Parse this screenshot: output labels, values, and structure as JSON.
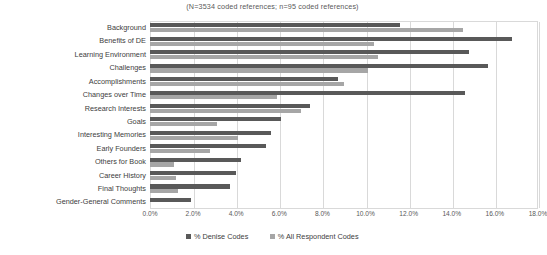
{
  "chart_data": {
    "type": "bar",
    "orientation": "horizontal",
    "title": "(N=3534 coded references; n=95 coded references)",
    "xlabel": "",
    "ylabel": "",
    "xlim": [
      0,
      18
    ],
    "xtick_labels": [
      "0.0%",
      "2.0%",
      "4.0%",
      "6.0%",
      "8.0%",
      "10.0%",
      "12.0%",
      "14.0%",
      "16.0%",
      "18.0%"
    ],
    "xticks": [
      0,
      2,
      4,
      6,
      8,
      10,
      12,
      14,
      16,
      18
    ],
    "grid": true,
    "legend_position": "bottom",
    "categories": [
      "Background",
      "Benefits of DE",
      "Learning Environment",
      "Challenges",
      "Accomplishments",
      "Changes over Time",
      "Research Interests",
      "Goals",
      "Interesting Memories",
      "Early Founders",
      "Others for Book",
      "Career History",
      "Final Thoughts",
      "Gender-General Comments"
    ],
    "series": [
      {
        "name": "% Denise Codes",
        "color": "#595959",
        "values": [
          11.6,
          16.8,
          14.8,
          15.7,
          8.7,
          14.6,
          7.4,
          6.1,
          5.6,
          5.4,
          4.2,
          4.0,
          3.7,
          1.9
        ]
      },
      {
        "name": "% All Respondent Codes",
        "color": "#a6a6a6",
        "values": [
          14.5,
          10.4,
          10.6,
          10.1,
          9.0,
          5.9,
          7.0,
          3.1,
          4.1,
          2.8,
          1.1,
          1.2,
          1.3,
          0.0
        ]
      }
    ]
  },
  "legend": {
    "items": [
      {
        "label": "% Denise Codes"
      },
      {
        "label": "% All Respondent Codes"
      }
    ]
  }
}
